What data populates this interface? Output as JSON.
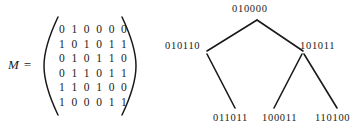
{
  "figure": {
    "matrix": {
      "label": "M =",
      "delimiter": "parentheses",
      "rows": [
        "0 1 0 0 0 0",
        "1 0 1 0 1 1",
        "0 1 0 1 1 0",
        "0 1 1 0 1 1",
        "1 1 0 1 0 0",
        "1 0 0 0 1 1"
      ]
    },
    "tree": {
      "root": "010000",
      "left_child": "010110",
      "right_child": "101011",
      "leaf_left": "011011",
      "leaf_middle": "100011",
      "leaf_right": "110100"
    },
    "colors": {
      "ink": "#1a1a1a",
      "background": "#ffffff"
    }
  }
}
